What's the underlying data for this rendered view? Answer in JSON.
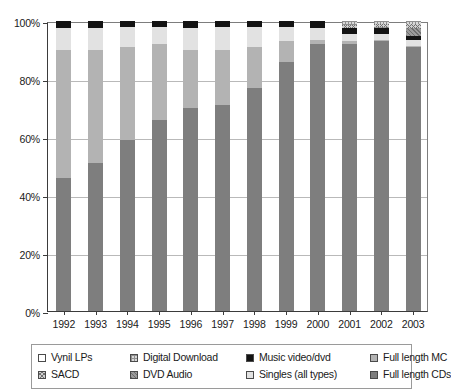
{
  "chart_data": {
    "type": "bar",
    "title": "",
    "subtitle": "",
    "xlabel": "",
    "ylabel": "",
    "stacked": true,
    "normalized_percent": true,
    "grid": true,
    "legend_position": "bottom",
    "ylim": [
      0,
      100
    ],
    "yticks": [
      "0%",
      "20%",
      "40%",
      "60%",
      "80%",
      "100%"
    ],
    "ytick_values": [
      0,
      20,
      40,
      60,
      80,
      100
    ],
    "categories": [
      "1992",
      "1993",
      "1994",
      "1995",
      "1996",
      "1997",
      "1998",
      "1999",
      "2000",
      "2001",
      "2002",
      "2003"
    ],
    "series": [
      {
        "name": "Full length CDs",
        "key": "cds",
        "fill": "f-cd",
        "color": "#7e7e7e",
        "values": [
          46,
          51,
          59,
          66,
          70,
          71,
          77,
          86,
          92,
          92,
          93,
          91
        ]
      },
      {
        "name": "Full length MC",
        "key": "mc",
        "fill": "f-mc",
        "color": "#b3b3b3",
        "values": [
          44,
          39,
          32,
          26,
          20,
          19,
          14,
          7,
          1.5,
          1,
          0.6,
          0.5
        ]
      },
      {
        "name": "Singles (all types)",
        "key": "singles",
        "fill": "f-singles",
        "color": "#e2e2e2",
        "values": [
          7.5,
          7.5,
          7,
          6,
          7.5,
          8,
          7,
          5,
          4,
          2.5,
          2,
          2
        ]
      },
      {
        "name": "Music video/dvd",
        "key": "music_video",
        "fill": "f-mv",
        "color": "#131313",
        "values": [
          2.5,
          2.5,
          2,
          2,
          2.5,
          2,
          2,
          2,
          2.5,
          2,
          2,
          1.5
        ]
      },
      {
        "name": "DVD Audio",
        "key": "dvd_audio",
        "fill": "f-dvda",
        "color": "#9a9a9a",
        "values": [
          0,
          0,
          0,
          0,
          0,
          0,
          0,
          0,
          0,
          0,
          0.4,
          2.5
        ]
      },
      {
        "name": "SACD",
        "key": "sacd",
        "fill": "f-sacd",
        "color": "#cfcfcf",
        "values": [
          0,
          0,
          0,
          0,
          0,
          0,
          0,
          0,
          0,
          1,
          1,
          1.5
        ]
      },
      {
        "name": "Digital Download",
        "key": "digital_download",
        "fill": "f-dd",
        "color": "#d8d8d8",
        "values": [
          0,
          0,
          0,
          0,
          0,
          0,
          0,
          0,
          0,
          1.5,
          1,
          1
        ]
      },
      {
        "name": "Vynil LPs",
        "key": "vinyl_lps",
        "fill": "f-lp",
        "color": "#ffffff",
        "values": [
          0,
          0,
          0,
          0,
          0,
          0,
          0,
          0,
          0,
          0,
          0,
          0
        ]
      }
    ],
    "stack_order_bottom_to_top": [
      "cds",
      "mc",
      "singles",
      "music_video",
      "dvd_audio",
      "sacd",
      "digital_download",
      "vinyl_lps"
    ]
  },
  "legend": {
    "items": [
      {
        "label": "Vynil LPs",
        "fill": "f-lp"
      },
      {
        "label": "Digital Download",
        "fill": "f-dd"
      },
      {
        "label": "Music video/dvd",
        "fill": "f-mv"
      },
      {
        "label": "Full length MC",
        "fill": "f-mc"
      },
      {
        "label": "SACD",
        "fill": "f-sacd"
      },
      {
        "label": "DVD Audio",
        "fill": "f-dvda"
      },
      {
        "label": "Singles (all types)",
        "fill": "f-singles"
      },
      {
        "label": "Full length CDs",
        "fill": "f-cd"
      }
    ]
  }
}
